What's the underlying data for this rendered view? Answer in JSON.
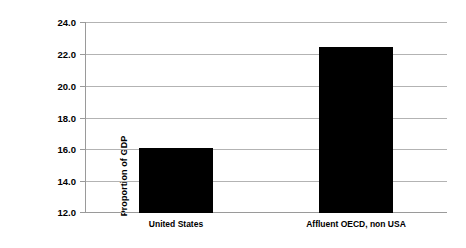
{
  "chart_data": {
    "type": "bar",
    "title": "",
    "subtitle": "",
    "xlabel": "",
    "ylabel": "Proportion of GDP",
    "categories": [
      "United States",
      "Affluent OECD, non USA"
    ],
    "values": [
      16.1,
      22.5
    ],
    "ylim": [
      12.0,
      24.0
    ],
    "yticks": [
      12.0,
      14.0,
      16.0,
      18.0,
      20.0,
      22.0,
      24.0
    ],
    "ytick_labels": [
      "12.0",
      "14.0",
      "16.0",
      "18.0",
      "20.0",
      "22.0",
      "24.0"
    ],
    "grid": true,
    "legend": false,
    "legend_position": "none",
    "bar_color": "#000000",
    "gridline_color": "#b3b3b3",
    "axis_color": "#9a9a9a",
    "text_color": "#000000",
    "background_color": "#ffffff"
  }
}
